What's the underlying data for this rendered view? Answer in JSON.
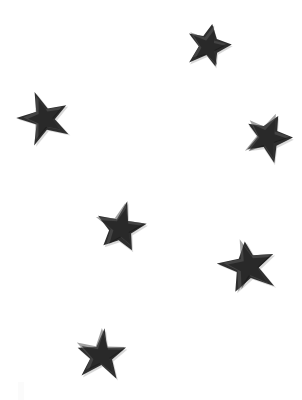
{
  "image": {
    "title": "Scattered Stars",
    "width": 302,
    "height": 400,
    "background_color": "#ffffff",
    "subject": "seven dark five-pointed stars scattered on a plain white background",
    "star_count": "7"
  },
  "palette": {
    "background": "#ffffff",
    "star_fill": "#2e2e2e",
    "star_highlight": "#555555",
    "star_shade": "#101010",
    "star_shadow": "#b9b9b9",
    "smudge": "#fbfbfb"
  },
  "stars": [
    {
      "id": "star-1",
      "label": "top star",
      "cx": 208,
      "cy": 46,
      "size": 25,
      "rotation": 14,
      "color": "#2e2e2e"
    },
    {
      "id": "star-2",
      "label": "upper-left star",
      "cx": 44,
      "cy": 118,
      "size": 27,
      "rotation": -16,
      "color": "#2e2e2e"
    },
    {
      "id": "star-3",
      "label": "right star",
      "cx": 267,
      "cy": 137,
      "size": 27,
      "rotation": 22,
      "color": "#2e2e2e"
    },
    {
      "id": "star-4",
      "label": "center star",
      "cx": 121,
      "cy": 228,
      "size": 27,
      "rotation": 8,
      "color": "#2e2e2e"
    },
    {
      "id": "star-5",
      "label": "lower-right star",
      "cx": 248,
      "cy": 266,
      "size": 29,
      "rotation": -12,
      "color": "#2e2e2e"
    },
    {
      "id": "star-6",
      "label": "bottom star",
      "cx": 101,
      "cy": 355,
      "size": 27,
      "rotation": 4,
      "color": "#2e2e2e"
    }
  ],
  "smudge": {
    "label": "faint paper smudge",
    "x": 18,
    "y": 382,
    "width": 6,
    "height": 18
  }
}
